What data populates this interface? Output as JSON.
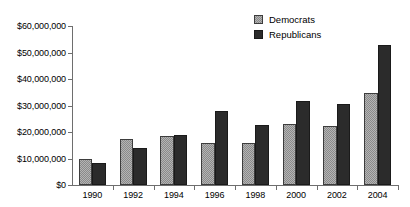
{
  "chart_data": {
    "type": "bar",
    "title": "",
    "subtitle": "",
    "xlabel": "",
    "ylabel": "",
    "categories": [
      "1990",
      "1992",
      "1994",
      "1996",
      "1998",
      "2000",
      "2002",
      "2004"
    ],
    "series": [
      {
        "name": "Democrats",
        "color": "#b4b4b4",
        "pattern": "checker-hatch",
        "values": [
          10000000,
          17500000,
          18500000,
          16000000,
          16000000,
          23200000,
          22400000,
          34900000
        ]
      },
      {
        "name": "Republicans",
        "color": "#2b2b2b",
        "pattern": "solid",
        "values": [
          8300000,
          14000000,
          18700000,
          27800000,
          22600000,
          31600000,
          30700000,
          52700000
        ]
      }
    ],
    "ylim": [
      0,
      60000000
    ],
    "ytick_values": [
      0,
      10000000,
      20000000,
      30000000,
      40000000,
      50000000,
      60000000
    ],
    "ytick_labels": [
      "$0",
      "$10,000,000",
      "$20,000,000",
      "$30,000,000",
      "$40,000,000",
      "$50,000,000",
      "$60,000,000"
    ],
    "grid": false,
    "legend_position": "top-right",
    "legend": [
      "Democrats",
      "Republicans"
    ]
  }
}
